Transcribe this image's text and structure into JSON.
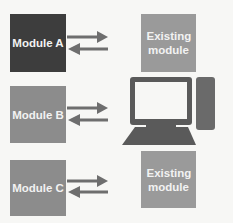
{
  "diagram": {
    "modules": [
      {
        "label": "Module A",
        "fill": "#3d3d3d"
      },
      {
        "label": "Module B",
        "fill": "#8c8c8c"
      },
      {
        "label": "Module C",
        "fill": "#8c8c8c"
      }
    ],
    "existing_modules": [
      {
        "label": "Existing module",
        "fill": "#9a9a9a"
      },
      {
        "label": "Existing module",
        "fill": "#9a9a9a"
      }
    ],
    "center_icon": "computer-icon",
    "arrow_color": "#6e6e6e",
    "connections": [
      {
        "from": "Module A",
        "to": "Existing module (top)",
        "direction": "bidirectional"
      },
      {
        "from": "Module B",
        "to": "Computer",
        "direction": "bidirectional"
      },
      {
        "from": "Module C",
        "to": "Existing module (bottom)",
        "direction": "bidirectional"
      }
    ]
  }
}
